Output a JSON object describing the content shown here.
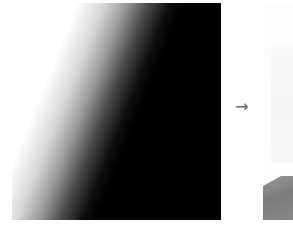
{
  "figure": {
    "input_panel": {
      "description": "diagonal white-to-black gradient",
      "colors": [
        "#ffffff",
        "#000000"
      ]
    },
    "arrow": {
      "glyph": "→",
      "color": "#6a6a6a"
    },
    "output_panel": {
      "description": "mostly white image with grey rock region bottom-left",
      "colors": [
        "#fdfdfd",
        "#8a8a8a"
      ]
    }
  }
}
